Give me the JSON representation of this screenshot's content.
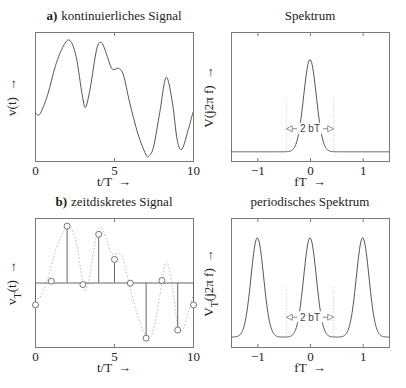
{
  "chart_data": [
    {
      "id": "a",
      "type": "line",
      "title_prefix": "a)",
      "title": "kontinuierliches Signal",
      "xlabel": "t/T",
      "xlabel_arrow": "→",
      "ylabel": "v(t)",
      "ylabel_arrow": "→",
      "xlim": [
        0,
        10
      ],
      "xticks": [
        0,
        5,
        10
      ],
      "xtick_labels": [
        "0",
        "5",
        "10"
      ],
      "yticks_shown": false,
      "grid": false,
      "x": [
        0,
        0.3,
        0.8,
        1.3,
        1.8,
        2.2,
        2.6,
        3.0,
        3.2,
        3.5,
        3.9,
        4.2,
        4.5,
        4.8,
        5.0,
        5.3,
        5.6,
        6.0,
        6.5,
        7.0,
        7.2,
        7.5,
        7.9,
        8.3,
        8.7,
        9.0,
        9.3,
        9.7,
        10.0
      ],
      "y": [
        0.05,
        0.02,
        0.3,
        0.72,
        1.0,
        1.08,
        0.85,
        0.28,
        0.12,
        0.4,
        0.95,
        1.05,
        0.9,
        0.7,
        0.66,
        0.68,
        0.58,
        0.18,
        -0.25,
        -0.55,
        -0.58,
        -0.45,
        0.05,
        0.55,
        0.18,
        -0.35,
        -0.48,
        -0.2,
        0.05
      ],
      "ylim": [
        -0.65,
        1.2
      ]
    },
    {
      "id": "spektrum",
      "type": "line",
      "title": "Spektrum",
      "xlabel": "fT",
      "xlabel_arrow": "→",
      "ylabel": "V(j2π f)",
      "ylabel_arrow": "→",
      "xlim": [
        -1.5,
        1.5
      ],
      "xticks": [
        -1,
        0,
        1
      ],
      "xtick_labels": [
        "−1",
        "0",
        "1"
      ],
      "yticks_shown": false,
      "grid": false,
      "peaks_at": [
        0
      ],
      "peak_height": 1.0,
      "gaussian_sigma": 0.12,
      "baseline": 0.0,
      "ylim": [
        -0.1,
        1.3
      ],
      "annotation": {
        "text": "2 bT",
        "x_from": -0.45,
        "x_to": 0.45,
        "y": 0.25
      }
    },
    {
      "id": "b",
      "type": "stem",
      "title_prefix": "b)",
      "title": "zeitdiskretes Signal",
      "xlabel": "t/T",
      "xlabel_arrow": "→",
      "ylabel": "v",
      "ylabel_sub": "T",
      "ylabel_rest": "(t)",
      "ylabel_arrow": "→",
      "xlim": [
        0,
        10
      ],
      "xticks": [
        0,
        5,
        10
      ],
      "xtick_labels": [
        "0",
        "5",
        "10"
      ],
      "yticks_shown": false,
      "grid": false,
      "ylim": [
        -0.95,
        0.95
      ],
      "x": [
        0,
        1,
        2,
        3,
        4,
        5,
        6,
        7,
        8,
        9,
        10
      ],
      "values": [
        -0.33,
        0.02,
        0.83,
        -0.03,
        0.71,
        0.34,
        -0.01,
        -0.82,
        0.03,
        -0.7,
        -0.33
      ],
      "envelope": "dotted continuous signal"
    },
    {
      "id": "periodisch",
      "type": "line",
      "title": "periodisches Spektrum",
      "xlabel": "fT",
      "xlabel_arrow": "→",
      "ylabel": "V",
      "ylabel_sub": "T",
      "ylabel_rest": "(j2π f)",
      "ylabel_arrow": "→",
      "xlim": [
        -1.5,
        1.5
      ],
      "xticks": [
        -1,
        0,
        1
      ],
      "xtick_labels": [
        "−1",
        "0",
        "1"
      ],
      "yticks_shown": false,
      "grid": false,
      "peaks_at": [
        -2,
        -1,
        0,
        1,
        2
      ],
      "peak_height": 1.0,
      "gaussian_sigma": 0.12,
      "baseline": 0.0,
      "ylim": [
        -0.1,
        1.2
      ],
      "annotation": {
        "text": "2 bT",
        "x_from": -0.45,
        "x_to": 0.45,
        "y": 0.2
      }
    }
  ],
  "layout": {
    "panels": [
      {
        "ref": 0,
        "frame": [
          35,
          32,
          193,
          161
        ]
      },
      {
        "ref": 1,
        "frame": [
          231,
          32,
          389,
          161
        ]
      },
      {
        "ref": 2,
        "frame": [
          35,
          218,
          193,
          347
        ]
      },
      {
        "ref": 3,
        "frame": [
          231,
          218,
          389,
          347
        ]
      }
    ]
  }
}
